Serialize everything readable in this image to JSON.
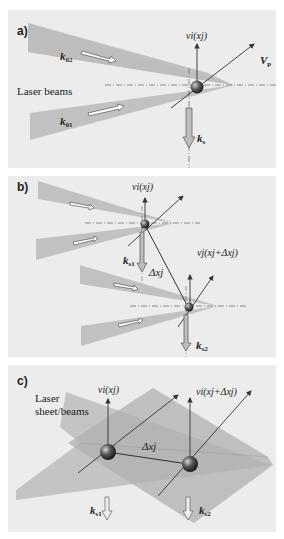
{
  "figure": {
    "panels": [
      {
        "id": "a",
        "letter": "a)",
        "side_label": "Laser beams",
        "beam_upper_label": "k",
        "beam_upper_sub": "02",
        "beam_lower_label": "k",
        "beam_lower_sub": "01",
        "velocity_label": "v_i(x_j)",
        "velocity_text": "vi(xj)",
        "particle_velocity_label": "V",
        "particle_velocity_sub": "p",
        "scatter_label": "k",
        "scatter_sub": "s"
      },
      {
        "id": "b",
        "letter": "b)",
        "velocity1_text": "vi(xj)",
        "velocity2_text": "vj(xj+Δxj)",
        "displacement_text": "Δxj",
        "scatter1_label": "k",
        "scatter1_sub": "s1",
        "scatter2_label": "k",
        "scatter2_sub": "s2"
      },
      {
        "id": "c",
        "letter": "c)",
        "side_label_line1": "Laser",
        "side_label_line2": "sheet/beams",
        "velocity1_text": "vi(xj)",
        "velocity2_text": "vi(xj+Δxj)",
        "displacement_text": "Δxj",
        "scatter1_label": "k",
        "scatter1_sub": "s1",
        "scatter2_label": "k",
        "scatter2_sub": "s2"
      }
    ],
    "colors": {
      "panel_bg": "#ececec",
      "beam_fill": "#bdbdbd",
      "line": "#333333",
      "particle": "#555555"
    }
  }
}
